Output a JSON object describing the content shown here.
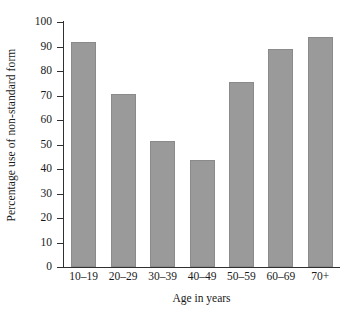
{
  "chart_data": {
    "type": "bar",
    "title": "",
    "xlabel": "Age in years",
    "ylabel": "Percentage use of non-standard form",
    "categories": [
      "10–19",
      "20–29",
      "30–39",
      "40–49",
      "50–59",
      "60–69",
      "70+"
    ],
    "values": [
      92,
      70.5,
      51.5,
      43.5,
      75.5,
      89,
      94
    ],
    "ylim": [
      0,
      100
    ],
    "ytick_labels": [
      "100",
      "90",
      "80",
      "70",
      "60",
      "50",
      "40",
      "30",
      "20",
      "10",
      "0"
    ],
    "ytick_values": [
      100,
      90,
      80,
      70,
      60,
      50,
      40,
      30,
      20,
      10,
      0
    ],
    "grid": false,
    "legend": null,
    "bar_color": "#9a9a9a",
    "bar_edge_color": "#8a8a8a",
    "axis_color": "#303030",
    "background": "#ffffff"
  }
}
